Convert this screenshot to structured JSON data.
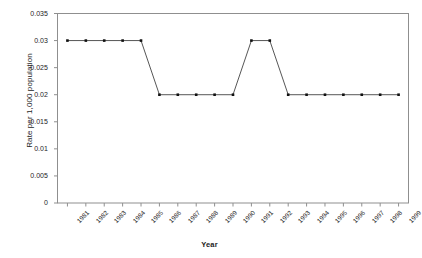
{
  "chart_data": {
    "type": "line",
    "title": "",
    "xlabel": "Year",
    "ylabel": "Rate per 1,000 population",
    "categories": [
      "1981",
      "1982",
      "1983",
      "1984",
      "1985",
      "1986",
      "1987",
      "1988",
      "1989",
      "1990",
      "1991",
      "1992",
      "1993",
      "1994",
      "1995",
      "1996",
      "1997",
      "1998",
      "1999"
    ],
    "values": [
      0.03,
      0.03,
      0.03,
      0.03,
      0.03,
      0.02,
      0.02,
      0.02,
      0.02,
      0.02,
      0.03,
      0.03,
      0.02,
      0.02,
      0.02,
      0.02,
      0.02,
      0.02,
      0.02
    ],
    "series": [
      {
        "name": "Rate",
        "values": [
          0.03,
          0.03,
          0.03,
          0.03,
          0.03,
          0.02,
          0.02,
          0.02,
          0.02,
          0.02,
          0.03,
          0.03,
          0.02,
          0.02,
          0.02,
          0.02,
          0.02,
          0.02,
          0.02
        ]
      }
    ],
    "ylim": [
      0,
      0.035
    ],
    "yticks": [
      0,
      0.005,
      0.01,
      0.015,
      0.02,
      0.025,
      0.03,
      0.035
    ],
    "ytick_labels": [
      "0",
      "0.005",
      "0.01",
      "0.015",
      "0.02",
      "0.025",
      "0.03",
      "0.035"
    ],
    "grid": false,
    "legend": "none",
    "marker": "square",
    "line_color": "#2b2b2b",
    "marker_color": "#111111",
    "axis_color": "#8a8a8a",
    "plot_border": true,
    "background": "#ffffff"
  }
}
